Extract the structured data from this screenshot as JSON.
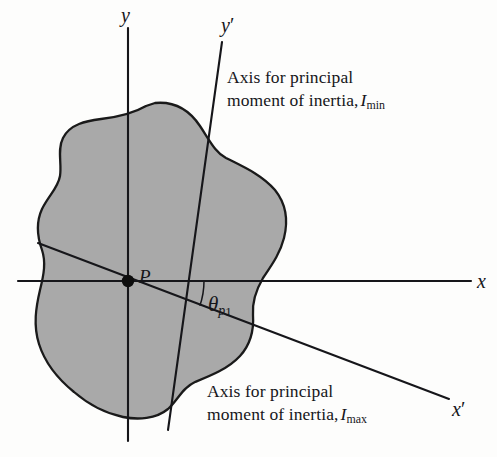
{
  "figure": {
    "colors": {
      "background": "#fdfdfc",
      "shape_fill": "#a9a9a9",
      "shape_stroke": "#1a1a1a",
      "axis_line": "#16161a",
      "text": "#16161a"
    }
  },
  "axes": [
    {
      "id": "y",
      "label": "y",
      "prime": "",
      "x": 121,
      "y": 2,
      "desc": "vertical centroidal axis"
    },
    {
      "id": "x",
      "label": "x",
      "prime": "",
      "x": 477,
      "y": 268,
      "desc": "horizontal centroidal axis"
    },
    {
      "id": "yprime",
      "label": "y",
      "prime": "′",
      "x": 221,
      "y": 12,
      "desc": "principal axis, minimum moment of inertia"
    },
    {
      "id": "xprime",
      "label": "x",
      "prime": "′",
      "x": 452,
      "y": 396,
      "desc": "principal axis, maximum moment of inertia"
    }
  ],
  "point": {
    "label": "P",
    "label_x": 139,
    "label_y": 264,
    "cx": 128,
    "cy": 281
  },
  "angle": {
    "symbol": "θ",
    "sub_p": "p",
    "sub_number": "1",
    "x": 208,
    "y": 291,
    "value_deg": 19,
    "desc": "angle from x axis to x′ principal axis"
  },
  "annotations": [
    {
      "id": "imin",
      "line1": "Axis for principal",
      "line2": "moment of inertia,",
      "symbol": "I",
      "subscript": "min",
      "x": 227,
      "y": 66
    },
    {
      "id": "imax",
      "line1": "Axis for principal",
      "line2": "moment of inertia,",
      "symbol": "I",
      "subscript": "max",
      "x": 207,
      "y": 380
    }
  ],
  "geometry": {
    "x_axis": {
      "x1": 18,
      "y1": 281,
      "x2": 471,
      "y2": 281
    },
    "y_axis": {
      "x1": 128,
      "y1": 28,
      "x2": 128,
      "y2": 441
    },
    "yprime_axis": {
      "x1": 168,
      "y1": 430,
      "x2": 222,
      "y2": 42
    },
    "xprime_axis": {
      "x1": 38,
      "y1": 243,
      "x2": 449,
      "y2": 399
    },
    "shape_path": "M 155,103 C 176,101 190,111 200,126 C 210,141 215,152 226,158 C 244,167 262,175 275,190 C 287,205 288,222 284,238 C 280,254 271,266 263,278 C 256,290 252,302 253,315 C 254,330 250,345 240,356 C 228,369 210,376 195,382 C 182,388 178,400 168,409 C 156,419 138,420 123,417 C 104,413 88,404 74,392 C 58,379 45,363 39,344 C 33,325 36,307 40,290 C 44,274 46,262 42,250 C 37,236 36,222 42,209 C 49,195 58,188 60,176 C 62,163 57,150 63,138 C 70,124 86,121 101,119 C 118,117 134,113 146,106 Z"
  }
}
